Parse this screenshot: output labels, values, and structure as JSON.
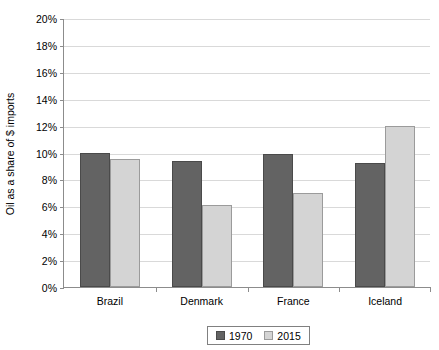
{
  "chart_data": {
    "type": "bar",
    "title": "",
    "xlabel": "",
    "ylabel": "Oil as a share of $ imports",
    "categories": [
      "Brazil",
      "Denmark",
      "France",
      "Iceland"
    ],
    "series": [
      {
        "name": "1970",
        "color": "#636363",
        "values": [
          10.0,
          9.4,
          9.9,
          9.2
        ]
      },
      {
        "name": "2015",
        "color": "#d4d4d4",
        "values": [
          9.5,
          6.1,
          7.0,
          12.0
        ]
      }
    ],
    "ylim": [
      0,
      20
    ],
    "ytick_values": [
      0,
      2,
      4,
      6,
      8,
      10,
      12,
      14,
      16,
      18,
      20
    ],
    "ytick_labels": [
      "0%",
      "2%",
      "4%",
      "6%",
      "8%",
      "10%",
      "12%",
      "14%",
      "16%",
      "18%",
      "20%"
    ],
    "grid": true,
    "legend_position": "bottom",
    "legend_entries": [
      "1970",
      "2015"
    ]
  }
}
